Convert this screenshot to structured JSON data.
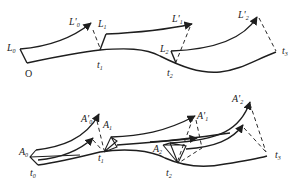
{
  "top_diagram": {
    "origin_label": "O",
    "labels": [
      {
        "id": "L0",
        "base": "L",
        "prime": "",
        "sub": "0"
      },
      {
        "id": "L0p",
        "base": "L",
        "prime": "'",
        "sub": "0"
      },
      {
        "id": "L1",
        "base": "L",
        "prime": "",
        "sub": "1"
      },
      {
        "id": "L1p",
        "base": "L",
        "prime": "'",
        "sub": "1"
      },
      {
        "id": "L2",
        "base": "L",
        "prime": "",
        "sub": "2"
      },
      {
        "id": "L2p",
        "base": "L",
        "prime": "'",
        "sub": "2"
      },
      {
        "id": "t1",
        "base": "t",
        "prime": "",
        "sub": "1"
      },
      {
        "id": "t2",
        "base": "t",
        "prime": "",
        "sub": "2"
      },
      {
        "id": "t3",
        "base": "t",
        "prime": "",
        "sub": "3"
      }
    ]
  },
  "bottom_diagram": {
    "labels": [
      {
        "id": "A0",
        "base": "A",
        "prime": "",
        "sub": "0"
      },
      {
        "id": "A0p",
        "base": "A",
        "prime": "'",
        "sub": "0"
      },
      {
        "id": "A1",
        "base": "A",
        "prime": "",
        "sub": "1"
      },
      {
        "id": "A1p",
        "base": "A",
        "prime": "'",
        "sub": "1"
      },
      {
        "id": "A2",
        "base": "A",
        "prime": "",
        "sub": "2"
      },
      {
        "id": "A2p",
        "base": "A",
        "prime": "'",
        "sub": "2"
      },
      {
        "id": "t0",
        "base": "t",
        "prime": "",
        "sub": "0"
      },
      {
        "id": "t1",
        "base": "t",
        "prime": "",
        "sub": "1"
      },
      {
        "id": "t2",
        "base": "t",
        "prime": "",
        "sub": "2"
      },
      {
        "id": "t3",
        "base": "t",
        "prime": "",
        "sub": "3"
      }
    ]
  }
}
